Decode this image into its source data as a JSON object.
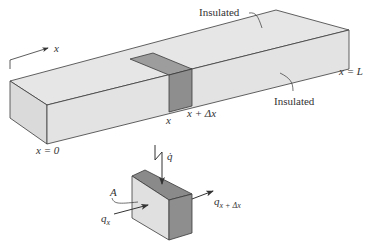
{
  "figure": {
    "axis_label": "x",
    "labels": {
      "insulated_top": "Insulated",
      "insulated_front": "Insulated",
      "x_start": "x = 0",
      "x_end": "x = L",
      "slice_left": "x",
      "slice_right": "x + Δx",
      "area": "A",
      "heat_source": "q̇",
      "flux_in_base": "q",
      "flux_in_sub": "x",
      "flux_out_base": "q",
      "flux_out_sub": "x + Δx"
    },
    "colors": {
      "face_light": "#e3e3e3",
      "face_light_side": "#dadada",
      "slice_dark": "#8e8e8e",
      "slice_top": "#9d9d9d",
      "edge": "#3a3a3a",
      "text": "#333333"
    }
  }
}
